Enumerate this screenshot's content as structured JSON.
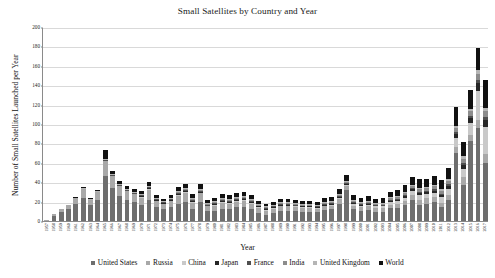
{
  "chart_data": {
    "type": "bar",
    "stacked": true,
    "title": "Small Satellites by Country and Year",
    "xlabel": "Year",
    "ylabel": "Number of Small Satellites Launched per Year",
    "ylim": [
      0,
      200
    ],
    "yticks": [
      0,
      20,
      40,
      60,
      80,
      100,
      120,
      140,
      160,
      180,
      200
    ],
    "grid": "horizontal",
    "legend_position": "bottom",
    "categories": [
      "1957",
      "1958",
      "1959",
      "1960",
      "1961",
      "1962",
      "1963",
      "1964",
      "1965",
      "1966",
      "1967",
      "1968",
      "1969",
      "1970",
      "1971",
      "1972",
      "1973",
      "1974",
      "1975",
      "1976",
      "1977",
      "1978",
      "1979",
      "1980",
      "1981",
      "1982",
      "1983",
      "1984",
      "1985",
      "1986",
      "1987",
      "1988",
      "1989",
      "1990",
      "1991",
      "1992",
      "1993",
      "1994",
      "1995",
      "1996",
      "1997",
      "1998",
      "1999",
      "2000",
      "2001",
      "2002",
      "2003",
      "2004",
      "2005",
      "2006",
      "2007",
      "2008",
      "2009",
      "2010",
      "2011",
      "2012",
      "2013",
      "2014",
      "2015",
      "2016",
      "2017"
    ],
    "series": [
      {
        "name": "United States",
        "color": "#6e6e6e",
        "values": [
          0,
          5,
          9,
          12,
          18,
          24,
          16,
          22,
          46,
          34,
          26,
          22,
          20,
          16,
          22,
          14,
          12,
          14,
          18,
          20,
          12,
          20,
          10,
          10,
          12,
          12,
          14,
          14,
          12,
          8,
          6,
          8,
          10,
          10,
          10,
          9,
          9,
          9,
          11,
          12,
          18,
          32,
          12,
          10,
          11,
          9,
          9,
          13,
          13,
          16,
          22,
          16,
          18,
          20,
          14,
          22,
          70,
          37,
          82,
          96,
          60
        ]
      },
      {
        "name": "Russia",
        "color": "#a8a8a8",
        "values": [
          1,
          2,
          3,
          5,
          6,
          9,
          6,
          8,
          16,
          12,
          10,
          9,
          8,
          8,
          10,
          7,
          6,
          7,
          8,
          9,
          7,
          9,
          5,
          6,
          7,
          6,
          6,
          7,
          6,
          5,
          4,
          4,
          5,
          5,
          4,
          4,
          4,
          3,
          4,
          4,
          5,
          4,
          4,
          4,
          4,
          4,
          4,
          4,
          5,
          5,
          5,
          6,
          6,
          5,
          5,
          5,
          6,
          8,
          7,
          8,
          9
        ]
      },
      {
        "name": "China",
        "color": "#c9c9c9",
        "values": [
          0,
          0,
          0,
          0,
          0,
          0,
          0,
          0,
          0,
          0,
          0,
          0,
          0,
          1,
          1,
          0,
          0,
          0,
          1,
          1,
          1,
          0,
          0,
          1,
          1,
          1,
          1,
          1,
          1,
          1,
          1,
          1,
          1,
          1,
          1,
          1,
          1,
          1,
          1,
          1,
          1,
          1,
          2,
          2,
          2,
          2,
          2,
          3,
          3,
          3,
          4,
          5,
          4,
          4,
          6,
          6,
          10,
          9,
          12,
          30,
          28
        ]
      },
      {
        "name": "Japan",
        "color": "#262626",
        "values": [
          0,
          0,
          0,
          0,
          0,
          0,
          0,
          0,
          0,
          0,
          0,
          0,
          0,
          1,
          1,
          1,
          1,
          1,
          1,
          1,
          1,
          1,
          1,
          1,
          1,
          1,
          1,
          1,
          1,
          1,
          1,
          1,
          1,
          1,
          1,
          1,
          1,
          1,
          1,
          1,
          1,
          1,
          1,
          1,
          1,
          1,
          1,
          1,
          1,
          2,
          2,
          2,
          2,
          2,
          2,
          3,
          4,
          4,
          5,
          8,
          7
        ]
      },
      {
        "name": "France",
        "color": "#4f4f4f",
        "values": [
          0,
          0,
          0,
          0,
          0,
          0,
          0,
          0,
          1,
          1,
          1,
          1,
          1,
          1,
          1,
          1,
          1,
          1,
          1,
          1,
          1,
          1,
          1,
          1,
          1,
          1,
          1,
          1,
          1,
          1,
          1,
          1,
          1,
          1,
          1,
          1,
          1,
          1,
          1,
          1,
          1,
          1,
          1,
          1,
          1,
          1,
          1,
          1,
          1,
          1,
          1,
          1,
          1,
          2,
          1,
          2,
          2,
          2,
          2,
          3,
          3
        ]
      },
      {
        "name": "India",
        "color": "#8c8c8c",
        "values": [
          0,
          0,
          0,
          0,
          0,
          0,
          0,
          0,
          0,
          0,
          0,
          0,
          0,
          0,
          0,
          0,
          0,
          0,
          1,
          1,
          1,
          1,
          1,
          1,
          1,
          1,
          1,
          1,
          1,
          1,
          1,
          1,
          1,
          1,
          1,
          1,
          1,
          1,
          1,
          1,
          1,
          1,
          1,
          1,
          1,
          1,
          1,
          2,
          2,
          2,
          2,
          3,
          3,
          3,
          3,
          3,
          4,
          4,
          5,
          7,
          6
        ]
      },
      {
        "name": "United Kingdom",
        "color": "#b5b5b5",
        "values": [
          0,
          0,
          0,
          0,
          0,
          1,
          1,
          1,
          1,
          1,
          1,
          1,
          1,
          1,
          1,
          1,
          1,
          1,
          1,
          1,
          1,
          1,
          1,
          1,
          1,
          1,
          1,
          1,
          1,
          1,
          1,
          1,
          1,
          1,
          1,
          1,
          1,
          1,
          1,
          1,
          1,
          1,
          1,
          1,
          1,
          1,
          1,
          1,
          1,
          1,
          1,
          1,
          1,
          1,
          2,
          2,
          2,
          3,
          3,
          4,
          4
        ]
      },
      {
        "name": "World",
        "color": "#111111",
        "values": [
          0,
          0,
          0,
          0,
          1,
          1,
          1,
          1,
          9,
          4,
          3,
          3,
          3,
          3,
          4,
          3,
          2,
          3,
          4,
          4,
          4,
          5,
          3,
          3,
          4,
          4,
          4,
          4,
          4,
          3,
          3,
          3,
          3,
          3,
          3,
          3,
          3,
          3,
          4,
          4,
          5,
          6,
          5,
          4,
          5,
          4,
          5,
          5,
          6,
          7,
          8,
          9,
          8,
          9,
          9,
          12,
          20,
          14,
          19,
          22,
          28
        ]
      }
    ]
  }
}
